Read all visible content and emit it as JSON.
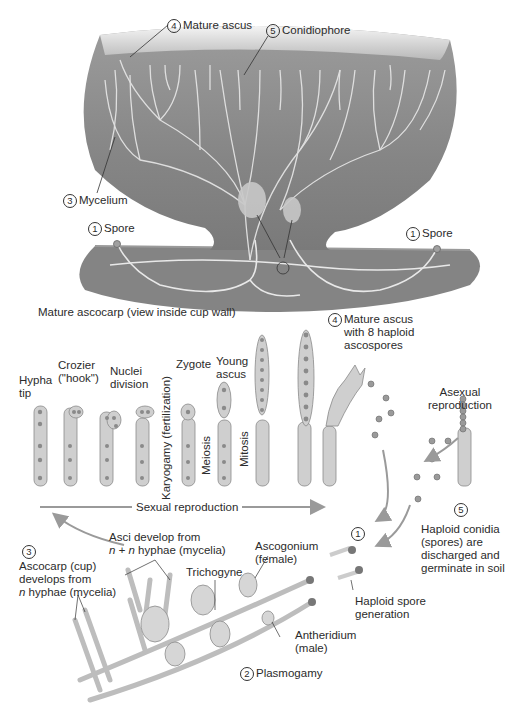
{
  "figure": {
    "palette": {
      "cup_fill": "#8a8a8a",
      "cup_rim": "#d8d8d8",
      "soil": "#7e7e7e",
      "hyphae": "#e6e6e6",
      "cell_fill": "#cfcfcf",
      "cell_stroke": "#8a8a8a",
      "nucleus": "#7a7a7a",
      "arrow": "#9a9a9a",
      "text": "#2b2b2b"
    }
  },
  "ascocarp": {
    "labels": {
      "mature_ascus": {
        "num": "4",
        "text": "Mature ascus"
      },
      "conidiophore": {
        "num": "5",
        "text": "Conidiophore"
      },
      "mycelium": {
        "num": "3",
        "text": "Mycelium"
      },
      "spore_left": {
        "num": "1",
        "text": "Spore"
      },
      "spore_right": {
        "num": "1",
        "text": "Spore"
      },
      "plasmogamy_marker": {
        "num": "2"
      }
    },
    "caption": "Mature ascocarp (view inside cup wall)"
  },
  "sequence": {
    "stages": [
      {
        "label": "Hypha\ntip"
      },
      {
        "label": "Crozier\n(\"hook\")"
      },
      {
        "label": "Nuclei\ndivision"
      },
      {
        "label": ""
      },
      {
        "label": "Zygote"
      },
      {
        "label": "Young\nascus"
      },
      {
        "label": ""
      },
      {
        "label": ""
      }
    ],
    "vertical_labels": {
      "karyogamy": "Karyogamy (fertilization)",
      "meiosis": "Meiosis",
      "mitosis": "Mitosis"
    },
    "mature_ascus_label": {
      "num": "4",
      "text": "Mature ascus\nwith 8 haploid\nascospores"
    },
    "sexual_reproduction": "Sexual reproduction"
  },
  "asexual": {
    "title": "Asexual\nreproduction",
    "conidia_label": {
      "num": "5",
      "text": "Haploid conidia\n(spores) are\ndischarged and\ngerminate in soil"
    }
  },
  "germination": {
    "num": "1",
    "text": "Haploid spore\ngeneration"
  },
  "mating": {
    "ascocarp_label": {
      "num": "3",
      "text_a": "Ascocarp (cup)\ndevelops from",
      "text_b_italic": "n",
      "text_b": " hyphae (mycelia)"
    },
    "asci_label": {
      "line1": "Asci develop from",
      "italic": "n + n",
      "line2": " hyphae (mycelia)"
    },
    "trichogyne": "Trichogyne",
    "ascogonium": "Ascogonium\n(female)",
    "antheridium": "Antheridium\n(male)",
    "plasmogamy": {
      "num": "2",
      "text": "Plasmogamy"
    }
  }
}
